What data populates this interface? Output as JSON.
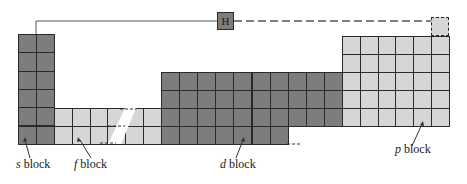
{
  "diagram": {
    "type": "periodic-table-blocks",
    "colors": {
      "s_block": "#7d7d7d",
      "d_block": "#7d7d7d",
      "f_block": "#d6d6d6",
      "p_block": "#d6d6d6",
      "grid_line": "#2a2a2a"
    },
    "hydrogen_label": "H",
    "blocks": [
      {
        "id": "s",
        "letter": "s",
        "word": "block",
        "cols": 2,
        "rows": 6
      },
      {
        "id": "f",
        "letter": "f",
        "word": "block",
        "cols": 6,
        "rows": 2
      },
      {
        "id": "d",
        "letter": "d",
        "word": "block",
        "cols": 10,
        "rows": 4
      },
      {
        "id": "p",
        "letter": "p",
        "word": "block",
        "cols": 6,
        "rows": 5
      }
    ]
  }
}
